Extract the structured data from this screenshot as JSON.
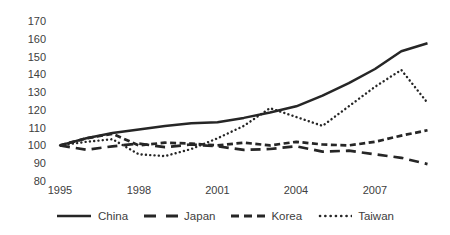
{
  "chart_data": {
    "type": "line",
    "title": "",
    "xlabel": "",
    "ylabel": "",
    "x": [
      1995,
      1996,
      1997,
      1998,
      1999,
      2000,
      2001,
      2002,
      2003,
      2004,
      2005,
      2006,
      2007,
      2008,
      2009
    ],
    "x_tick_labels": [
      "1995",
      "1998",
      "2001",
      "2004",
      "2007"
    ],
    "y_tick_labels": [
      "170",
      "160",
      "150",
      "140",
      "130",
      "120",
      "110",
      "100",
      "90",
      "80"
    ],
    "ylim": [
      80,
      170
    ],
    "grid": false,
    "axis_lines": false,
    "legend_position": "bottom",
    "line_color": "#262626",
    "series": [
      {
        "name": "China",
        "style": "solid",
        "values": [
          100,
          104,
          107,
          109,
          111,
          112.5,
          113,
          115.5,
          118.5,
          122,
          128,
          135,
          143,
          153,
          157.5
        ]
      },
      {
        "name": "Japan",
        "style": "long-dash",
        "values": [
          100,
          97.5,
          99.5,
          101,
          99,
          100.5,
          99.5,
          97.5,
          98,
          99.5,
          96.5,
          97,
          95,
          93,
          89.5
        ]
      },
      {
        "name": "Korea",
        "style": "dash",
        "values": [
          100,
          104,
          106.5,
          100,
          101.5,
          101,
          100,
          101.5,
          100,
          102,
          100.5,
          100,
          102,
          105.5,
          108.5
        ]
      },
      {
        "name": "Taiwan",
        "style": "dotted",
        "values": [
          100,
          102,
          103.5,
          95,
          94,
          98,
          104,
          111,
          121,
          116,
          111,
          122,
          133,
          142.5,
          124
        ]
      }
    ]
  }
}
